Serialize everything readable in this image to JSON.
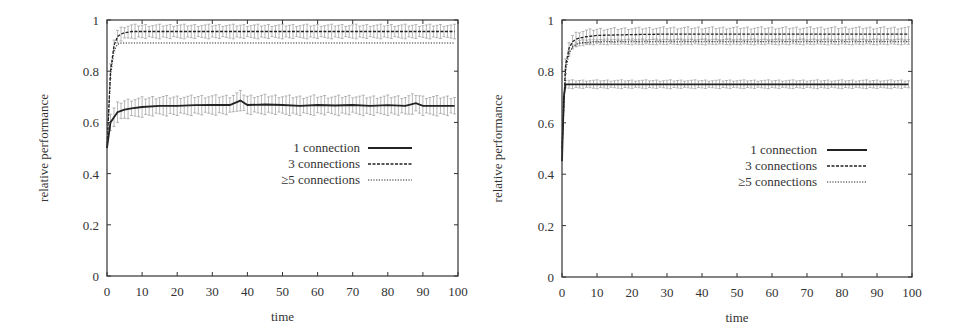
{
  "chart_data": [
    {
      "type": "line",
      "title": "",
      "xlabel": "time",
      "ylabel": "relative performance",
      "xlim": [
        0,
        100
      ],
      "ylim": [
        0,
        1
      ],
      "xticks": [
        "0",
        "10",
        "20",
        "30",
        "40",
        "50",
        "60",
        "70",
        "80",
        "90",
        "100"
      ],
      "yticks": [
        "0",
        "0.2",
        "0.4",
        "0.6",
        "0.8",
        "1"
      ],
      "grid": false,
      "legend_position": "center-right",
      "error_bars": true,
      "series": [
        {
          "name": "1 connection",
          "style": "solid",
          "x": [
            0,
            1,
            2,
            3,
            4,
            5,
            7,
            10,
            15,
            20,
            25,
            30,
            35,
            38,
            40,
            45,
            50,
            55,
            60,
            65,
            70,
            75,
            80,
            85,
            88,
            90,
            95,
            99
          ],
          "values": [
            0.5,
            0.6,
            0.62,
            0.64,
            0.645,
            0.65,
            0.655,
            0.66,
            0.665,
            0.665,
            0.667,
            0.668,
            0.668,
            0.685,
            0.668,
            0.67,
            0.668,
            0.665,
            0.668,
            0.666,
            0.668,
            0.665,
            0.667,
            0.665,
            0.675,
            0.665,
            0.665,
            0.665
          ],
          "error": 0.035
        },
        {
          "name": "3 connections",
          "style": "dashed",
          "x": [
            0,
            1,
            2,
            3,
            4,
            5,
            7,
            10,
            20,
            30,
            40,
            50,
            60,
            70,
            80,
            90,
            99
          ],
          "values": [
            0.5,
            0.8,
            0.9,
            0.935,
            0.945,
            0.95,
            0.955,
            0.955,
            0.955,
            0.955,
            0.955,
            0.955,
            0.955,
            0.955,
            0.955,
            0.955,
            0.955
          ],
          "error": 0.025
        },
        {
          "name": "≥5 connections",
          "style": "dotted",
          "x": [
            0,
            1,
            2,
            3,
            4,
            5,
            7,
            10,
            20,
            30,
            40,
            50,
            60,
            70,
            80,
            90,
            99
          ],
          "values": [
            0.5,
            0.78,
            0.88,
            0.905,
            0.91,
            0.91,
            0.91,
            0.91,
            0.91,
            0.91,
            0.91,
            0.91,
            0.91,
            0.91,
            0.91,
            0.91,
            0.91
          ],
          "error": 0.0
        }
      ]
    },
    {
      "type": "line",
      "title": "",
      "xlabel": "time",
      "ylabel": "relative performance",
      "xlim": [
        0,
        100
      ],
      "ylim": [
        0,
        1
      ],
      "xticks": [
        "0",
        "10",
        "20",
        "30",
        "40",
        "50",
        "60",
        "70",
        "80",
        "90",
        "100"
      ],
      "yticks": [
        "0",
        "0.2",
        "0.4",
        "0.6",
        "0.8",
        "1"
      ],
      "grid": false,
      "legend_position": "center-right",
      "error_bars": true,
      "series": [
        {
          "name": "1 connection",
          "style": "solid",
          "x": [
            0,
            0.5,
            1,
            2,
            3,
            5,
            10,
            20,
            30,
            40,
            50,
            60,
            70,
            80,
            90,
            99
          ],
          "values": [
            0.45,
            0.7,
            0.75,
            0.75,
            0.75,
            0.75,
            0.75,
            0.75,
            0.75,
            0.75,
            0.75,
            0.75,
            0.75,
            0.75,
            0.75,
            0.75
          ],
          "error": 0.015
        },
        {
          "name": "3 connections",
          "style": "dashed",
          "x": [
            0,
            1,
            2,
            3,
            4,
            5,
            7,
            10,
            20,
            30,
            40,
            50,
            60,
            70,
            80,
            90,
            99
          ],
          "values": [
            0.5,
            0.82,
            0.89,
            0.915,
            0.925,
            0.93,
            0.935,
            0.94,
            0.943,
            0.945,
            0.945,
            0.945,
            0.945,
            0.945,
            0.945,
            0.945,
            0.945
          ],
          "error": 0.025
        },
        {
          "name": "≥5 connections",
          "style": "dotted",
          "x": [
            0,
            1,
            2,
            3,
            4,
            5,
            7,
            10,
            20,
            30,
            40,
            50,
            60,
            70,
            80,
            90,
            99
          ],
          "values": [
            0.5,
            0.8,
            0.87,
            0.895,
            0.905,
            0.91,
            0.913,
            0.915,
            0.915,
            0.915,
            0.915,
            0.915,
            0.915,
            0.915,
            0.915,
            0.915,
            0.915
          ],
          "error": 0.01
        }
      ]
    }
  ],
  "charts": [
    {
      "xlabel": "time",
      "ylabel": "relative performance",
      "legend": [
        "1 connection",
        "3 connections",
        "≥5 connections"
      ]
    },
    {
      "xlabel": "time",
      "ylabel": "relative performance",
      "legend": [
        "1 connection",
        "3 connections",
        "≥5 connections"
      ]
    }
  ],
  "layout": [
    {
      "left": 0,
      "plot": {
        "x0": 107,
        "x1": 458,
        "y0": 276,
        "y1": 20
      },
      "ylabel_x": 48,
      "legend": {
        "text_right": 360,
        "line_x0": 368,
        "line_x1": 412,
        "y0": 148,
        "dy": 16
      }
    },
    {
      "left": 0,
      "plot": {
        "x0": 562,
        "x1": 912,
        "y0": 277,
        "y1": 20
      },
      "ylabel_x": 502,
      "legend": {
        "text_right": 817,
        "line_x0": 827,
        "line_x1": 867,
        "y0": 150,
        "dy": 16
      }
    }
  ],
  "colors": {
    "axis": "#333333",
    "line": "#222222",
    "error": "#999999"
  }
}
